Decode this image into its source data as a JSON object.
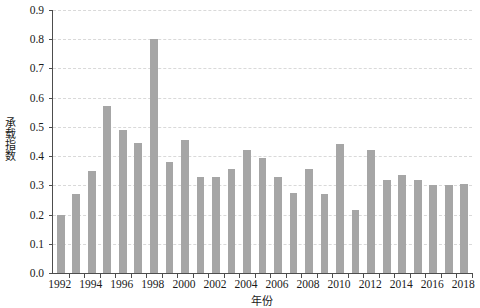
{
  "chart_data": {
    "type": "bar",
    "title": "",
    "subtitle": "",
    "xlabel": "年份",
    "ylabel": "承载指数",
    "ylim": [
      0.0,
      0.9
    ],
    "ytick_labels": [
      "0.0",
      "0.1",
      "0.2",
      "0.3",
      "0.4",
      "0.5",
      "0.6",
      "0.7",
      "0.8",
      "0.9"
    ],
    "ytick_values": [
      0.0,
      0.1,
      0.2,
      0.3,
      0.4,
      0.5,
      0.6,
      0.7,
      0.8,
      0.9
    ],
    "xtick_labels": [
      "1992",
      "1994",
      "1996",
      "1998",
      "2000",
      "2002",
      "2004",
      "2006",
      "2008",
      "2010",
      "2012",
      "2014",
      "2016",
      "2018"
    ],
    "grid": "horizontal-dashed",
    "legend": "none",
    "legend_position": "none",
    "bar_color": "#a6a6a6",
    "axis_color": "#4d4d4d",
    "grid_color": "#d9d9d9",
    "text_color": "#1a1a1a",
    "background": "#ffffff",
    "categories": [
      "1992",
      "1993",
      "1994",
      "1995",
      "1996",
      "1997",
      "1998",
      "1999",
      "2000",
      "2001",
      "2002",
      "2003",
      "2004",
      "2005",
      "2006",
      "2007",
      "2008",
      "2009",
      "2010",
      "2011",
      "2012",
      "2013",
      "2014",
      "2015",
      "2016",
      "2017",
      "2018"
    ],
    "values": [
      0.2,
      0.27,
      0.35,
      0.57,
      0.49,
      0.445,
      0.8,
      0.38,
      0.455,
      0.33,
      0.33,
      0.355,
      0.42,
      0.395,
      0.33,
      0.275,
      0.355,
      0.27,
      0.44,
      0.215,
      0.42,
      0.32,
      0.335,
      0.32,
      0.3,
      0.3,
      0.305
    ],
    "series": [
      {
        "name": "承载指数",
        "values": [
          0.2,
          0.27,
          0.35,
          0.57,
          0.49,
          0.445,
          0.8,
          0.38,
          0.455,
          0.33,
          0.33,
          0.355,
          0.42,
          0.395,
          0.33,
          0.275,
          0.355,
          0.27,
          0.44,
          0.215,
          0.42,
          0.32,
          0.335,
          0.32,
          0.3,
          0.3,
          0.305
        ]
      }
    ]
  }
}
